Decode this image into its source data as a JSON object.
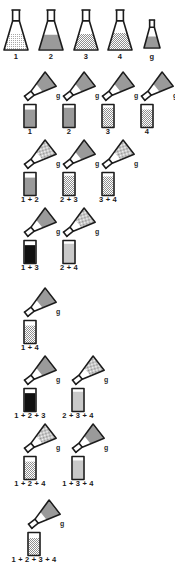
{
  "figure": {
    "type": "scientific-diagram",
    "background_color": "#ffffff",
    "ink_color": "#1c1c1c",
    "fill_solid_color": "#9a9a9a",
    "fill_dark_color": "#101010",
    "fill_light_color": "#c9c9c9",
    "reagent_label": "g"
  },
  "source_row": {
    "name": "stock-flasks",
    "flasks": [
      {
        "label": "1",
        "fill": "light-stipple",
        "level": 0.55,
        "size": "large"
      },
      {
        "label": "2",
        "fill": "solid-gray",
        "level": 0.52,
        "size": "large"
      },
      {
        "label": "3",
        "fill": "stipple",
        "level": 0.55,
        "size": "large"
      },
      {
        "label": "4",
        "fill": "stipple",
        "level": 0.58,
        "size": "large"
      },
      {
        "label": "g",
        "fill": "solid-gray",
        "level": 0.55,
        "size": "small"
      }
    ]
  },
  "test_rows": [
    {
      "name": "singles",
      "units": [
        {
          "label": "1",
          "tube_fill": "solid-gray",
          "tube_level": 0.8,
          "pour_fill": "solid-gray",
          "pour_label": "g"
        },
        {
          "label": "2",
          "tube_fill": "solid-gray",
          "tube_level": 0.88,
          "pour_fill": "solid-gray",
          "pour_label": "g"
        },
        {
          "label": "3",
          "tube_fill": "stipple",
          "tube_level": 0.88,
          "pour_fill": "solid-gray",
          "pour_label": "g"
        },
        {
          "label": "4",
          "tube_fill": "stipple",
          "tube_level": 0.8,
          "pour_fill": "solid-gray",
          "pour_label": "g"
        }
      ]
    },
    {
      "name": "adjacent-pairs",
      "units": [
        {
          "label": "1 + 2",
          "tube_fill": "solid-gray",
          "tube_level": 0.8,
          "pour_fill": "stipple",
          "pour_label": "g"
        },
        {
          "label": "2 + 3",
          "tube_fill": "stipple",
          "tube_level": 0.88,
          "pour_fill": "solid-gray",
          "pour_label": "g"
        },
        {
          "label": "3 + 4",
          "tube_fill": "stipple",
          "tube_level": 0.85,
          "pour_fill": "stipple",
          "pour_label": "g"
        }
      ]
    },
    {
      "name": "skip-pairs",
      "units": [
        {
          "label": "1 + 3",
          "tube_fill": "dark",
          "tube_level": 0.82,
          "pour_fill": "solid-gray",
          "pour_label": "g"
        },
        {
          "label": "2 + 4",
          "tube_fill": "light",
          "tube_level": 0.88,
          "pour_fill": "stipple",
          "pour_label": "g"
        }
      ]
    },
    {
      "name": "outer-pair",
      "units": [
        {
          "label": "1 + 4",
          "tube_fill": "stipple",
          "tube_level": 0.8,
          "pour_fill": "solid-gray",
          "pour_label": "g"
        }
      ]
    },
    {
      "name": "triples-a",
      "units": [
        {
          "label": "1 + 2 + 3",
          "tube_fill": "dark",
          "tube_level": 0.82,
          "pour_fill": "solid-gray",
          "pour_label": "g"
        },
        {
          "label": "2 + 3 + 4",
          "tube_fill": "light",
          "tube_level": 0.88,
          "pour_fill": "stipple",
          "pour_label": "g"
        }
      ]
    },
    {
      "name": "triples-b",
      "units": [
        {
          "label": "1 + 2 + 4",
          "tube_fill": "stipple",
          "tube_level": 0.8,
          "pour_fill": "stipple",
          "pour_label": "g"
        },
        {
          "label": "1 + 3 + 4",
          "tube_fill": "light",
          "tube_level": 0.85,
          "pour_fill": "solid-gray",
          "pour_label": "g"
        }
      ]
    },
    {
      "name": "all-four",
      "units": [
        {
          "label": "1 + 2 + 3 + 4",
          "tube_fill": "stipple",
          "tube_level": 0.78,
          "pour_fill": "solid-gray",
          "pour_label": "g"
        }
      ]
    }
  ]
}
